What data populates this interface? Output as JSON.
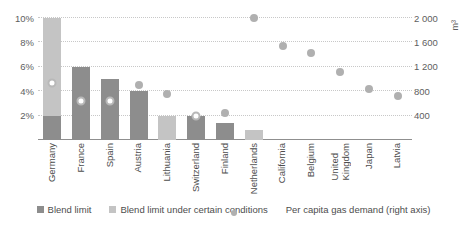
{
  "chart_data": {
    "type": "bar",
    "title": "",
    "subtitle": "",
    "xlabel": "",
    "ylabel": "",
    "y2label": "m³",
    "ylim": [
      0,
      10
    ],
    "y2lim": [
      0,
      2000
    ],
    "grid": true,
    "legend_position": "bottom",
    "categories": [
      "Germany",
      "France",
      "Spain",
      "Austria",
      "Lithuania",
      "Switzerland",
      "Finland",
      "Netherlands",
      "California",
      "Belgium",
      "United\nKingdom",
      "Japan",
      "Latvia"
    ],
    "yticks": [
      "2%",
      "4%",
      "6%",
      "8%",
      "10%"
    ],
    "ytick_values": [
      2,
      4,
      6,
      8,
      10
    ],
    "y2ticks": [
      "400",
      "800",
      "1 200",
      "1 600",
      "2 000"
    ],
    "y2tick_values": [
      400,
      800,
      1200,
      1600,
      2000
    ],
    "series": [
      {
        "name": "Blend limit",
        "color": "#8d8d8d",
        "unit": "%",
        "axis": "left",
        "values": [
          2,
          6,
          5,
          4,
          null,
          2,
          1.4,
          null,
          null,
          null,
          null,
          null,
          null
        ]
      },
      {
        "name": "Blend limit under certain conditions",
        "color": "#c4c4c4",
        "unit": "%",
        "axis": "left",
        "values": [
          10,
          null,
          null,
          null,
          2,
          null,
          null,
          0.8,
          null,
          null,
          null,
          null,
          null
        ]
      },
      {
        "name": "Per capita gas demand (right axis)",
        "color": "#b0b0b0",
        "unit": "m³",
        "axis": "right",
        "values": [
          940,
          640,
          640,
          900,
          760,
          400,
          440,
          2000,
          1540,
          1430,
          1110,
          840,
          720
        ]
      }
    ]
  },
  "legend": {
    "items": [
      {
        "label": "Blend limit",
        "marker": "square-dark"
      },
      {
        "label": "Blend limit under certain conditions",
        "marker": "square-light"
      },
      {
        "label": "Per capita gas demand (right axis)",
        "marker": "circle"
      }
    ]
  }
}
